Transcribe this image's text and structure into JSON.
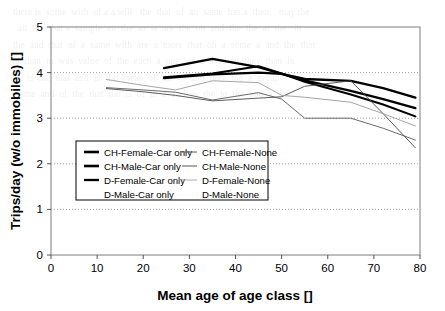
{
  "chart_data": {
    "type": "line",
    "title": "",
    "xlabel": "Mean age of age class []",
    "ylabel": "Trips/day (w/o immobiles) []",
    "xlim": [
      0,
      80
    ],
    "ylim": [
      0,
      5
    ],
    "xticks": [
      0,
      10,
      20,
      30,
      40,
      50,
      60,
      70,
      80
    ],
    "yticks": [
      0,
      1,
      2,
      3,
      4,
      5
    ],
    "xtick_labels": [
      "0",
      "10",
      "20",
      "30",
      "40",
      "50",
      "60",
      "70",
      "80"
    ],
    "ytick_labels": [
      "0",
      "1",
      "2",
      "3",
      "4",
      "5"
    ],
    "grid": "horizontal-dotted",
    "legend_position": "inside-lower-left",
    "series": [
      {
        "name": "CH-Female-Car only",
        "color": "#000000",
        "width": 2.3,
        "x": [
          24.5,
          35,
          45,
          50,
          55,
          65,
          72,
          79
        ],
        "y": [
          4.1,
          4.3,
          4.12,
          3.97,
          3.86,
          3.82,
          3.66,
          3.45
        ]
      },
      {
        "name": "CH-Male-Car only",
        "color": "#000000",
        "width": 2.3,
        "x": [
          24.5,
          35,
          45,
          50,
          55,
          65,
          72,
          79
        ],
        "y": [
          3.88,
          3.96,
          4.0,
          3.97,
          3.83,
          3.6,
          3.42,
          3.22
        ]
      },
      {
        "name": "D-Female-Car only",
        "color": "#000000",
        "width": 2.0,
        "x": [
          24.5,
          35,
          45,
          50,
          55,
          65,
          72,
          79
        ],
        "y": [
          3.9,
          3.98,
          4.14,
          3.98,
          3.8,
          3.52,
          3.3,
          3.04
        ]
      },
      {
        "name": "D-Male-Car only",
        "color": "#000000",
        "width": 0,
        "x": [],
        "y": []
      },
      {
        "name": "CH-Female-None",
        "color": "#5a5a5a",
        "width": 0.9,
        "x": [
          12,
          20,
          27,
          35,
          45,
          50,
          55,
          65,
          72,
          79
        ],
        "y": [
          3.67,
          3.62,
          3.57,
          3.4,
          3.56,
          3.42,
          3.0,
          3.0,
          2.78,
          2.52
        ]
      },
      {
        "name": "CH-Male-None",
        "color": "#4a4a4a",
        "width": 0.9,
        "x": [
          12,
          20,
          27,
          35,
          45,
          50,
          55,
          65,
          72,
          79
        ],
        "y": [
          3.65,
          3.58,
          3.5,
          3.38,
          3.44,
          3.47,
          3.7,
          3.82,
          3.1,
          2.35
        ]
      },
      {
        "name": "D-Female-None",
        "color": "#9a9a9a",
        "width": 0.9,
        "x": [
          12,
          20,
          27,
          35,
          45,
          50,
          55,
          65,
          72,
          79
        ],
        "y": [
          3.85,
          3.72,
          3.62,
          3.82,
          3.78,
          3.5,
          3.46,
          3.35,
          3.1,
          2.83
        ]
      },
      {
        "name": "D-Male-None",
        "color": "#9a9a9a",
        "width": 0,
        "x": [],
        "y": []
      }
    ],
    "legend_entries": [
      {
        "label": "CH-Female-Car only",
        "swatch": true,
        "color": "#000000",
        "width": 2.6,
        "col": 0,
        "row": 0
      },
      {
        "label": "CH-Male-Car only",
        "swatch": true,
        "color": "#000000",
        "width": 2.6,
        "col": 0,
        "row": 1
      },
      {
        "label": "D-Female-Car only",
        "swatch": true,
        "color": "#000000",
        "width": 2.3,
        "col": 0,
        "row": 2
      },
      {
        "label": "D-Male-Car only",
        "swatch": false,
        "color": "#000000",
        "width": 0,
        "col": 0,
        "row": 3
      },
      {
        "label": "CH-Female-None",
        "swatch": true,
        "color": "#555555",
        "width": 1.0,
        "col": 1,
        "row": 0
      },
      {
        "label": "CH-Male-None",
        "swatch": true,
        "color": "#555555",
        "width": 1.0,
        "col": 1,
        "row": 1
      },
      {
        "label": "D-Female-None",
        "swatch": true,
        "color": "#aaaaaa",
        "width": 1.0,
        "col": 1,
        "row": 2
      },
      {
        "label": "D-Male-None",
        "swatch": false,
        "color": "#aaaaaa",
        "width": 0,
        "col": 1,
        "row": 3
      }
    ]
  },
  "background_bleed": {
    "visible": true,
    "text": "  there is  some  with  of a a will   the  that  of  an  same  has a  then    may the\n    an  the  that a  sample  an  the  as  is  are  the  on  and  the  the  at  the   in\n  the  and  that  of  a  same  with  are  a  more  that  on  a  some  a  and  the  that\n  is  than  in  was  value  of  the  each  a  one   as  a  used  in  they  than  in\n    a  is  the  that  and  in  the  mean  of  the  in  and  they  the  a  group\n   some  and  of  the  that  the  is  of  in  a  and  as  the  to  the  and  a  in\n"
  }
}
